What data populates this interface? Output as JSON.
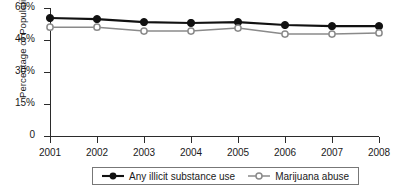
{
  "chart_data": {
    "type": "line",
    "title": "",
    "xlabel": "",
    "ylabel": "Percentage of Population",
    "categories": [
      "2001",
      "2002",
      "2003",
      "2004",
      "2005",
      "2006",
      "2007",
      "2008"
    ],
    "x": [
      2001,
      2002,
      2003,
      2004,
      2005,
      2006,
      2007,
      2008
    ],
    "ylim": [
      0,
      60
    ],
    "yticks": [
      0,
      15,
      30,
      45,
      60
    ],
    "ytick_labels": [
      "0",
      "15%",
      "30%",
      "45%",
      "60%"
    ],
    "grid": false,
    "legend_position": "bottom-center",
    "series": [
      {
        "name": "Any illicit substance use",
        "marker": "filled-circle",
        "color": "#111111",
        "values": [
          55.3,
          54.8,
          53.4,
          53.0,
          53.4,
          52.0,
          51.5,
          51.5
        ]
      },
      {
        "name": "Marijuana abuse",
        "marker": "open-circle",
        "color": "#8a8a8a",
        "values": [
          51.0,
          51.0,
          49.2,
          49.2,
          50.6,
          47.8,
          47.8,
          48.3
        ]
      }
    ]
  },
  "colors": {
    "axis": "#2b2b2b",
    "text": "#1a1a1a",
    "series_filled": "#111111",
    "series_open_line": "#8a8a8a",
    "series_open_fill": "#ffffff",
    "legend_border": "#777777",
    "background": "#ffffff"
  }
}
